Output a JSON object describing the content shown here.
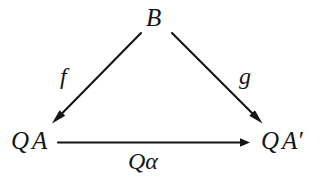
{
  "diagram": {
    "kind": "commutative-triangle",
    "ink_color": "#151515",
    "background_color": "#ffffff",
    "nodes": [
      {
        "id": "B",
        "label": "B",
        "position": "apex"
      },
      {
        "id": "QA",
        "label_q": "Q",
        "label_a": "A",
        "label_prime": "",
        "label": "QA",
        "position": "bottom-left"
      },
      {
        "id": "QAprime",
        "label_q": "Q",
        "label_a": "A",
        "label_prime": "′",
        "label": "QA′",
        "position": "bottom-right"
      }
    ],
    "edges": [
      {
        "id": "f",
        "label": "f",
        "from": "B",
        "to": "QA",
        "direction": "down-left"
      },
      {
        "id": "g",
        "label": "g",
        "from": "B",
        "to": "QAprime",
        "direction": "down-right"
      },
      {
        "id": "Qalpha",
        "label_q": "Q",
        "label_symbol": "α",
        "label": "Qα",
        "from": "QA",
        "to": "QAprime",
        "direction": "right"
      }
    ]
  }
}
